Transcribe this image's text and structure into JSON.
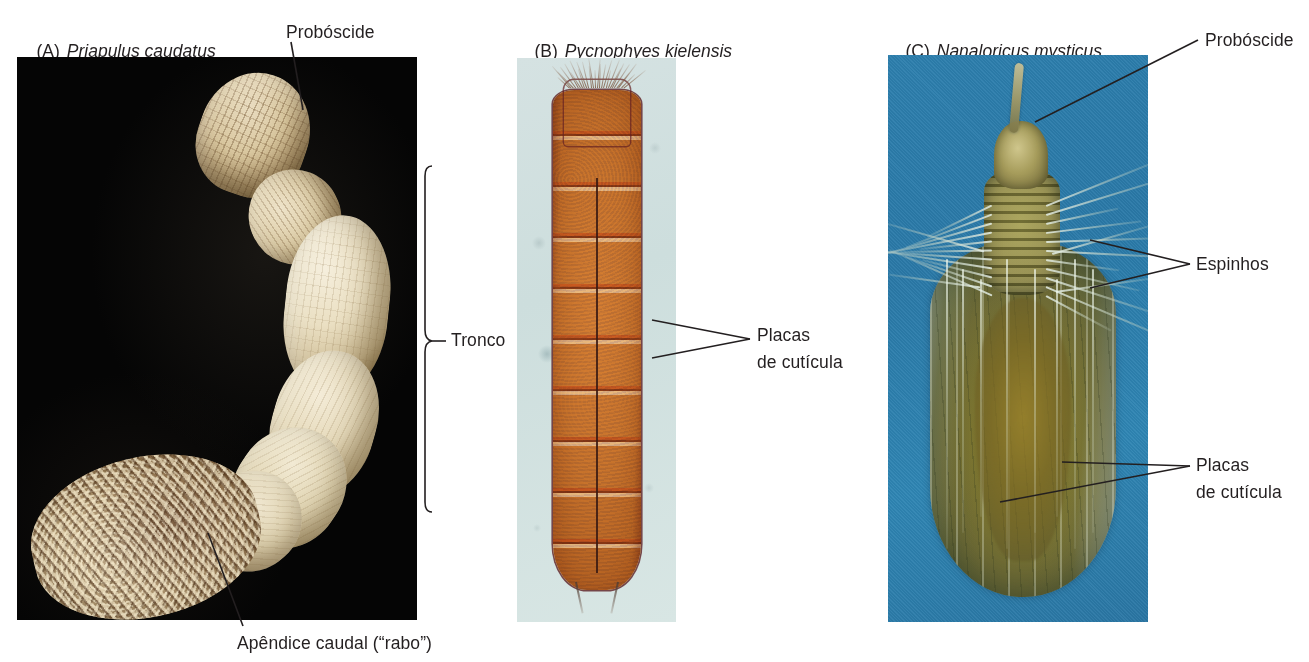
{
  "figure": {
    "panels": [
      {
        "id": "A",
        "tag": "(A)",
        "species": "Priapulus caudatus",
        "background": "#070707",
        "organism": "priapulid worm",
        "labels": [
          {
            "name": "proboscide",
            "text": "Probóscide"
          },
          {
            "name": "tronco",
            "text": "Tronco"
          },
          {
            "name": "apendice-caudal",
            "text": "Apêndice caudal (“rabo”)"
          }
        ]
      },
      {
        "id": "B",
        "tag": "(B)",
        "species": "Pycnophyes kielensis",
        "background": "#d5e2e2",
        "organism": "kinorhynch",
        "labels": [
          {
            "name": "placas-de-cuticula",
            "line1": "Placas",
            "line2": "de cutícula"
          }
        ]
      },
      {
        "id": "C",
        "tag": "(C)",
        "species": "Nanaloricus mysticus",
        "background": "#2d7fae",
        "organism": "loriciferan",
        "labels": [
          {
            "name": "proboscide",
            "text": "Probóscide"
          },
          {
            "name": "espinhos",
            "text": "Espinhos"
          },
          {
            "name": "placas-de-cuticula",
            "line1": "Placas",
            "line2": "de cutícula"
          }
        ]
      }
    ],
    "text_color": "#231f20"
  }
}
